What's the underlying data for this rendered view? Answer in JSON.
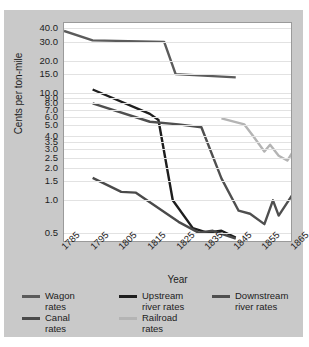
{
  "chart_data": {
    "type": "line",
    "title": "",
    "xlabel": "Year",
    "ylabel": "Cents per ton-mile",
    "yscale": "log",
    "ylim": [
      0.4,
      45
    ],
    "xlim": [
      1785,
      1865
    ],
    "grid": true,
    "legend_position": "bottom",
    "x_ticks": [
      1785,
      1795,
      1805,
      1815,
      1825,
      1835,
      1845,
      1855,
      1865
    ],
    "x_tick_labels": [
      "1785",
      "1795",
      "1805",
      "1815",
      "1825",
      "1835",
      "1845",
      "1855",
      "1865"
    ],
    "y_ticks": [
      40.0,
      30.0,
      20.0,
      15.0,
      10.0,
      9.0,
      8.0,
      7.0,
      6.0,
      5.0,
      4.0,
      3.5,
      3.0,
      2.5,
      2.0,
      1.5,
      1.0,
      0.5
    ],
    "y_tick_labels": [
      "40.0",
      "30.0",
      "20.0",
      "15.0",
      "10.0",
      "9.0",
      "8.0",
      "7.0",
      "6.0",
      "5.0",
      "4.0",
      "3.5",
      "3.0",
      "2.5",
      "2.0",
      "1.5",
      "1.0",
      "0.5"
    ],
    "series": [
      {
        "name": "Wagon rates",
        "color": "#5b5b5b",
        "width": 2.4,
        "x": [
          1785,
          1795,
          1820,
          1824,
          1845
        ],
        "y": [
          38.0,
          31.0,
          30.0,
          15.0,
          14.0
        ]
      },
      {
        "name": "Upstream river rates",
        "color": "#1e1e1e",
        "width": 2.4,
        "x": [
          1795,
          1815,
          1818,
          1823,
          1830,
          1835,
          1840,
          1845
        ],
        "y": [
          10.8,
          6.4,
          5.6,
          1.0,
          0.55,
          0.5,
          0.52,
          0.45
        ]
      },
      {
        "name": "Downstream river rates",
        "color": "#4f4f4f",
        "width": 2.4,
        "x": [
          1795,
          1815,
          1825,
          1833,
          1840,
          1846,
          1850,
          1855,
          1858,
          1860,
          1865
        ],
        "y": [
          8.0,
          5.4,
          5.1,
          4.8,
          1.6,
          0.8,
          0.75,
          0.6,
          1.0,
          0.72,
          1.15
        ]
      },
      {
        "name": "Canal rates",
        "color": "#4a4a4a",
        "width": 2.4,
        "x": [
          1795,
          1805,
          1810,
          1825,
          1832,
          1837,
          1845
        ],
        "y": [
          1.62,
          1.2,
          1.18,
          0.63,
          0.5,
          0.52,
          0.44
        ]
      },
      {
        "name": "Railroad rates",
        "color": "#b4b4b4",
        "width": 2.4,
        "x": [
          1840,
          1848,
          1851,
          1855,
          1857,
          1860,
          1863,
          1865
        ],
        "y": [
          5.8,
          5.1,
          4.0,
          2.85,
          3.3,
          2.6,
          2.35,
          2.85
        ]
      }
    ]
  },
  "legend": {
    "items": [
      {
        "label": "Wagon\nrates",
        "color": "#5b5b5b"
      },
      {
        "label": "Upstream\nriver rates",
        "color": "#1e1e1e"
      },
      {
        "label": "Downstream\nriver rates",
        "color": "#4f4f4f"
      },
      {
        "label": "Canal\nrates",
        "color": "#4a4a4a"
      },
      {
        "label": "Railroad\nrates",
        "color": "#b4b4b4"
      }
    ]
  }
}
